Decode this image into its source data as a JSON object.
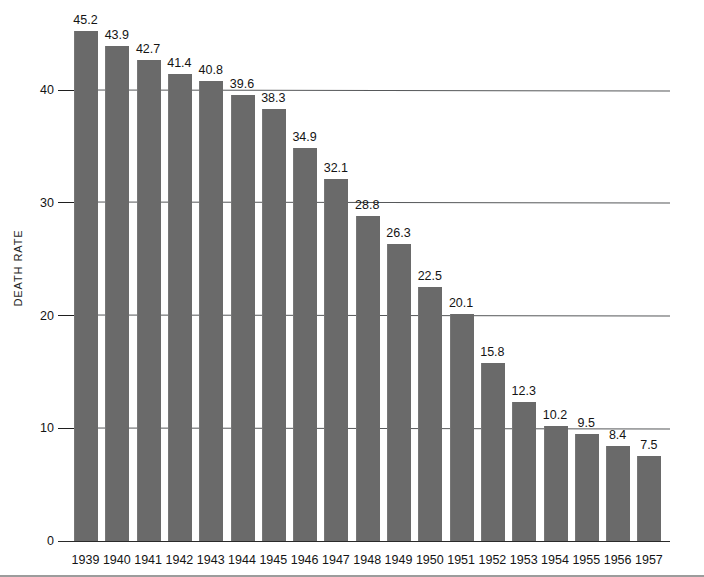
{
  "chart_data": {
    "type": "bar",
    "title": "",
    "subtitle": "",
    "xlabel": "",
    "ylabel": "DEATH RATE",
    "categories": [
      "1939",
      "1940",
      "1941",
      "1942",
      "1943",
      "1944",
      "1945",
      "1946",
      "1947",
      "1948",
      "1949",
      "1950",
      "1951",
      "1952",
      "1953",
      "1954",
      "1955",
      "1956",
      "1957"
    ],
    "values": [
      45.2,
      43.9,
      42.7,
      41.4,
      40.8,
      39.6,
      38.3,
      34.9,
      32.1,
      28.8,
      26.3,
      22.5,
      20.1,
      15.8,
      12.3,
      10.2,
      9.5,
      8.4,
      7.5
    ],
    "value_labels": [
      "45.2",
      "43.9",
      "42.7",
      "41.4",
      "40.8",
      "39.6",
      "38.3",
      "34.9",
      "32.1",
      "28.8",
      "26.3",
      "22.5",
      "20.1",
      "15.8",
      "12.3",
      "10.2",
      "9.5",
      "8.4",
      "7.5"
    ],
    "ylim": [
      0,
      47.5
    ],
    "yticks": [
      0,
      10,
      20,
      30,
      40
    ],
    "ytick_labels": [
      "0",
      "10",
      "20",
      "30",
      "40"
    ],
    "grid": true,
    "legend": null,
    "series_color": "#6a6a6a",
    "background": "#ffffff",
    "axis_color": "#2a2a2a"
  },
  "axis": {
    "y_title": "DEATH RATE"
  }
}
